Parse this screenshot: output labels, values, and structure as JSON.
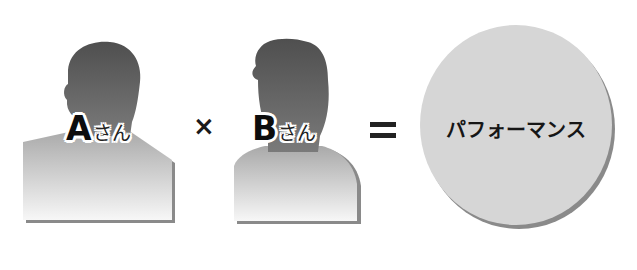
{
  "diagram": {
    "person_a": {
      "letter": "A",
      "suffix": "さん"
    },
    "operator_multiply": "×",
    "person_b": {
      "letter": "B",
      "suffix": "さん"
    },
    "operator_equals": "=",
    "result": {
      "label": "パフォーマンス"
    }
  },
  "colors": {
    "head_dark": "#555555",
    "body_top": "#b5b5b5",
    "body_bottom": "#f4f4f4",
    "shadow": "#8a8a8a",
    "circle_fill": "#d6d6d6"
  }
}
